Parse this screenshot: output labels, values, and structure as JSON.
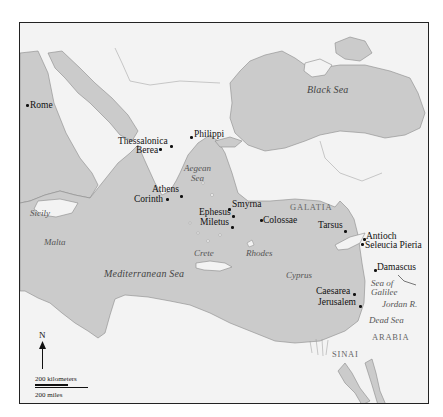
{
  "map": {
    "colors": {
      "sea": "#c9c9c9",
      "land": "#f3f3f3",
      "border": "#222222",
      "coast": "#8a8a8a",
      "city_text": "#111111",
      "water_text": "#555555",
      "region_text": "#666666"
    },
    "cities": [
      {
        "name": "Rome"
      },
      {
        "name": "Philippi"
      },
      {
        "name": "Thessalonica"
      },
      {
        "name": "Berea"
      },
      {
        "name": "Athens"
      },
      {
        "name": "Corinth"
      },
      {
        "name": "Smyrna"
      },
      {
        "name": "Ephesus"
      },
      {
        "name": "Miletus"
      },
      {
        "name": "Colossae"
      },
      {
        "name": "Tarsus"
      },
      {
        "name": "Antioch"
      },
      {
        "name": "Seleucia Pieria"
      },
      {
        "name": "Damascus"
      },
      {
        "name": "Caesarea"
      },
      {
        "name": "Jerusalem"
      }
    ],
    "water_bodies": [
      {
        "name": "Black Sea"
      },
      {
        "name": "Aegean"
      },
      {
        "name": "Sea"
      },
      {
        "name": "Mediterranean Sea"
      },
      {
        "name": "Sea of"
      },
      {
        "name": "Galilee"
      },
      {
        "name": "Jordan R."
      },
      {
        "name": "Dead Sea"
      }
    ],
    "islands": [
      {
        "name": "Sicily"
      },
      {
        "name": "Malta"
      },
      {
        "name": "Crete"
      },
      {
        "name": "Rhodes"
      },
      {
        "name": "Cyprus"
      }
    ],
    "regions": [
      {
        "name": "GALATIA"
      },
      {
        "name": "ARABIA"
      },
      {
        "name": "SINAI"
      }
    ],
    "compass": {
      "label": "N"
    },
    "scale_bar": {
      "km_label": "200 kilometers",
      "mi_label": "200 miles"
    }
  }
}
